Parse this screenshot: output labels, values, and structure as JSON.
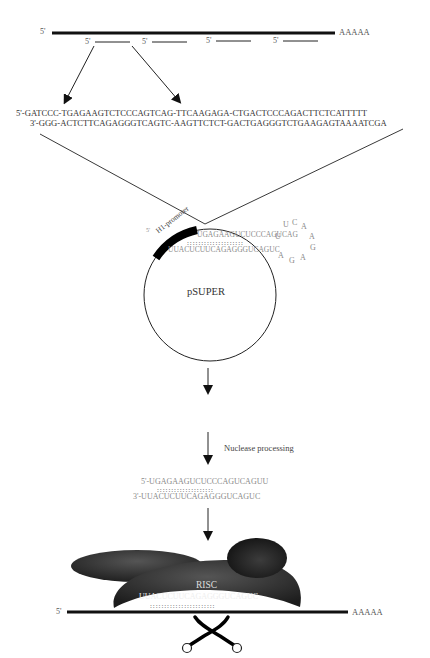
{
  "mrna_top": {
    "five_prime": "5'",
    "poly_a": "AAAAA",
    "target_sites": [
      "5'",
      "5'",
      "5'",
      "5'"
    ]
  },
  "oligo": {
    "top_strand": "5'-GATCCC-TGAGAAGTCTCCCAGTCAG-TTCAAGAGA-CTGACTCCCAGACTTCTCATTTTT",
    "bottom_strand": "3'-GGG-ACTCTTCAGAGGGTCAGTC-AAGTTCTCT-GACTGAGGGTCTGAAGAGTAAAATCGA"
  },
  "plasmid": {
    "name": "pSUPER",
    "promoter_label": "H1-promoter",
    "promoter_five_prime": "5'",
    "hairpin_top": "UGAGAAGUCUCCCAGUCAG",
    "hairpin_bottom": "UUACUCUUCAGAGGGUCAGUC",
    "loop_letters": [
      "U",
      "U",
      "C",
      "A",
      "A",
      "G",
      "A",
      "G",
      "A"
    ]
  },
  "steps": {
    "nuclease_label": "Nuclease processing"
  },
  "sirna": {
    "sense": "5'-UGAGAAGUCUCCCAGUCAGUU",
    "antisense": "3'-UUACUCUUCAGAGGGUCAGUC",
    "pairs": "::::::::::::::::::::"
  },
  "risc": {
    "label": "RISC",
    "guide_strand": "UUACUCUUCAGAGGGUCAGUC",
    "pairs": ":::::::::::::::::::::::"
  },
  "mrna_bottom": {
    "five_prime": "5'",
    "poly_a": "AAAAA"
  },
  "icons": {
    "cleavage": "scissors-icon"
  },
  "colors": {
    "line": "#111111",
    "text": "#333333",
    "rna_text": "#8a8a8a",
    "risc_fill": "#2b2b2b"
  }
}
